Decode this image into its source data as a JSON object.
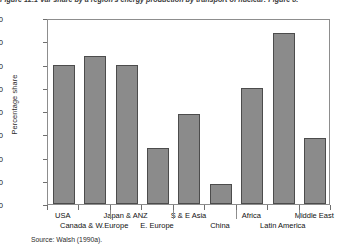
{
  "caption": "Figure 12.1  Var share by a region's energy production by transport of nuclear: Figure 8.",
  "source_note": "Source: Walsh (1990a).",
  "chart_data": {
    "type": "bar",
    "title": "",
    "xlabel": "",
    "ylabel": "Percentage share",
    "ylim": [
      0,
      40
    ],
    "yticks": [
      "0.0",
      "5.0",
      "10.0",
      "15.0",
      "20.0",
      "25.0",
      "30.0",
      "35.0",
      "40.0"
    ],
    "ytick_values": [
      0,
      5,
      10,
      15,
      20,
      25,
      30,
      35,
      40
    ],
    "grid": false,
    "legend": null,
    "bar_color": "#8b8b8b",
    "bar_edge_color": "#4c4c4c",
    "categories": [
      "USA",
      "Canada & W.Europe",
      "Japan & ANZ",
      "E. Europe",
      "S & E Asia",
      "China",
      "Africa",
      "Latin America",
      "Middle East"
    ],
    "label_rows": [
      0,
      1,
      0,
      1,
      0,
      1,
      0,
      1,
      0
    ],
    "values": [
      30.0,
      31.8,
      30.0,
      12.0,
      19.3,
      4.3,
      25.0,
      36.8,
      14.3
    ]
  }
}
